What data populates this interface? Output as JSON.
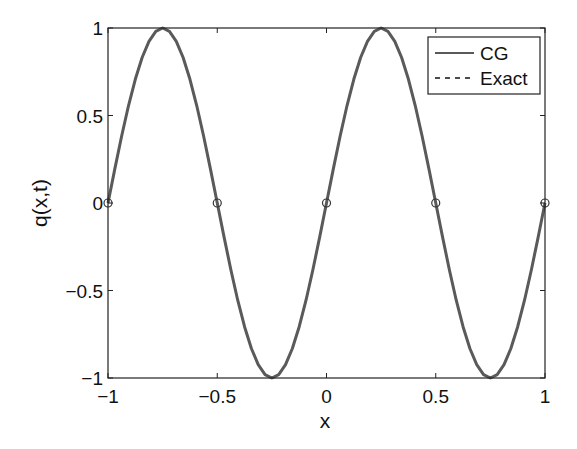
{
  "chart_data": {
    "type": "line",
    "title": "",
    "xlabel": "x",
    "ylabel": "q(x,t)",
    "xlim": [
      -1,
      1
    ],
    "ylim": [
      -1,
      1
    ],
    "grid": false,
    "legend_position": "upper right",
    "x_ticks": [
      -1,
      -0.5,
      0,
      0.5,
      1
    ],
    "x_tick_labels": [
      "−1",
      "−0.5",
      "0",
      "0.5",
      "1"
    ],
    "y_ticks": [
      -1,
      -0.5,
      0,
      0.5,
      1
    ],
    "y_tick_labels": [
      "−1",
      "−0.5",
      "0",
      "0.5",
      "1"
    ],
    "series": [
      {
        "name": "CG",
        "style": "solid",
        "color": "#5a5a5a",
        "function": "sin(2*pi*(x+1))",
        "x": [
          -1,
          -0.875,
          -0.75,
          -0.625,
          -0.5,
          -0.375,
          -0.25,
          -0.125,
          0,
          0.125,
          0.25,
          0.375,
          0.5,
          0.625,
          0.75,
          0.875,
          1
        ],
        "values": [
          0,
          0.707,
          1,
          0.707,
          0,
          -0.707,
          -1,
          -0.707,
          0,
          0.707,
          1,
          0.707,
          0,
          -0.707,
          -1,
          -0.707,
          0
        ]
      },
      {
        "name": "Exact",
        "style": "dashed",
        "color": "#111111",
        "function": "sin(2*pi*(x+1))",
        "x": [
          -1,
          -0.875,
          -0.75,
          -0.625,
          -0.5,
          -0.375,
          -0.25,
          -0.125,
          0,
          0.125,
          0.25,
          0.375,
          0.5,
          0.625,
          0.75,
          0.875,
          1
        ],
        "values": [
          0,
          0.707,
          1,
          0.707,
          0,
          -0.707,
          -1,
          -0.707,
          0,
          0.707,
          1,
          0.707,
          0,
          -0.707,
          -1,
          -0.707,
          0
        ]
      }
    ],
    "markers": {
      "shape": "circle-open",
      "x": [
        -1,
        -0.5,
        0,
        0.5,
        1
      ],
      "y": [
        0,
        0,
        0,
        0,
        0
      ]
    }
  },
  "legend": {
    "items": [
      {
        "label": "CG",
        "style": "solid"
      },
      {
        "label": "Exact",
        "style": "dashed"
      }
    ]
  },
  "colors": {
    "cg_line": "#5a5a5a",
    "exact_line": "#111111",
    "axes": "#222222"
  }
}
